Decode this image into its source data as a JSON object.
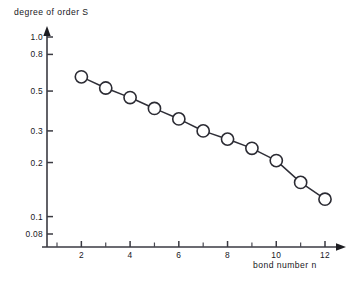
{
  "chart_data": {
    "type": "line",
    "title": "",
    "subtitle": "",
    "xlabel": "bond number n",
    "ylabel": "degree of order S",
    "x": [
      2,
      3,
      4,
      5,
      6,
      7,
      8,
      9,
      10,
      11,
      12
    ],
    "values": [
      0.6,
      0.52,
      0.46,
      0.4,
      0.35,
      0.3,
      0.27,
      0.24,
      0.205,
      0.155,
      0.125
    ],
    "series": [
      {
        "name": "degree of order S",
        "x": [
          2,
          3,
          4,
          5,
          6,
          7,
          8,
          9,
          10,
          11,
          12
        ],
        "values": [
          0.6,
          0.52,
          0.46,
          0.4,
          0.35,
          0.3,
          0.27,
          0.24,
          0.205,
          0.155,
          0.125
        ]
      }
    ],
    "marker": "open-circle",
    "xscale": "linear",
    "yscale": "log",
    "xlim": [
      1,
      12.6
    ],
    "ylim": [
      0.075,
      1.05
    ],
    "grid": false,
    "legend": false,
    "legend_position": "none",
    "x_ticks_major": [
      2,
      4,
      6,
      8,
      10,
      12
    ],
    "x_ticks_minor": [
      1,
      3,
      5,
      7,
      9,
      11
    ],
    "x_tick_labels": [
      "2",
      "4",
      "6",
      "8",
      "10",
      "12"
    ],
    "y_ticks": [
      0.08,
      0.1,
      0.2,
      0.3,
      0.5,
      0.8,
      1.0
    ],
    "y_tick_labels": [
      "0.08",
      "0.1",
      "0.2",
      "0.3",
      "0.5",
      "0.8",
      "1.0"
    ],
    "annotations": []
  },
  "axes": {
    "y_title": "degree of order S",
    "x_title": "bond number n"
  },
  "colors": {
    "marker_stroke": "#2b2b33",
    "marker_fill": "#ffffff",
    "line": "#2f2f38",
    "axis": "#3a3a42",
    "text": "#17171c",
    "background": "#ffffff"
  }
}
